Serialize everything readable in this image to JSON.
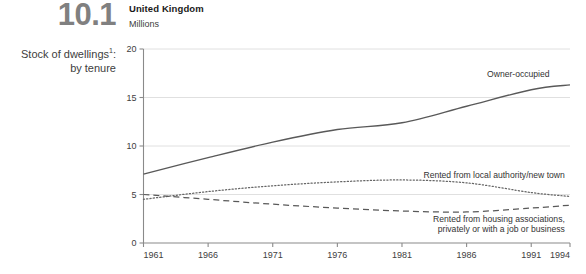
{
  "figure": {
    "number": "10.1",
    "title_line1": "Stock of dwellings",
    "title_footnote": "1",
    "title_punct": ":",
    "title_line2": "by tenure"
  },
  "chart_header": {
    "country": "United Kingdom",
    "units": "Millions"
  },
  "chart_data": {
    "type": "line",
    "subtitle": "United Kingdom",
    "xlabel": "",
    "ylabel": "Millions",
    "xlim": [
      1961,
      1994
    ],
    "ylim": [
      0,
      20
    ],
    "yticks": [
      0,
      5,
      10,
      15,
      20
    ],
    "ytick_labels": [
      "0",
      "5",
      "10",
      "15",
      "20"
    ],
    "xticks": [
      1961,
      1966,
      1971,
      1976,
      1981,
      1986,
      1991,
      1994
    ],
    "xtick_labels": [
      "1961",
      "1966",
      "1971",
      "1976",
      "1981",
      "1986",
      "1991",
      "1994"
    ],
    "grid": "horizontal",
    "legend_position": "inline-annotations",
    "x": [
      1961,
      1966,
      1971,
      1976,
      1981,
      1986,
      1991,
      1994
    ],
    "series": [
      {
        "name": "Owner-occupied",
        "style": "solid",
        "color": "#595959",
        "values": [
          7.1,
          8.8,
          10.4,
          11.7,
          12.4,
          14.1,
          15.8,
          16.3
        ]
      },
      {
        "name": "Rented from local authority/new town",
        "style": "dotted",
        "color": "#666666",
        "values": [
          4.5,
          5.3,
          5.9,
          6.3,
          6.5,
          6.2,
          5.2,
          4.8
        ]
      },
      {
        "name": "Rented from housing associations, privately or with a job or business",
        "style": "dashed",
        "color": "#595959",
        "values": [
          5.0,
          4.5,
          4.0,
          3.6,
          3.3,
          3.2,
          3.6,
          3.9
        ]
      }
    ],
    "annotations": [
      {
        "text": "Owner-occupied",
        "x": 1990.0,
        "y": 17.1,
        "anchor": "middle"
      },
      {
        "text": "Rented from local authority/new town",
        "x": 1993.6,
        "y": 6.7,
        "anchor": "end"
      },
      {
        "text": "Rented from housing associations,",
        "x": 1993.6,
        "y": 2.2,
        "anchor": "end"
      },
      {
        "text": "privately or with a job or business",
        "x": 1993.6,
        "y": 1.1,
        "anchor": "end"
      }
    ]
  },
  "colors": {
    "axis": "#8a8a8a",
    "grid": "#dddddd",
    "text": "#404040",
    "figure_number": "#808080"
  }
}
